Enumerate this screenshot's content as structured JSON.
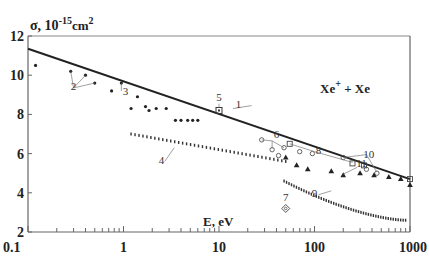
{
  "chart_data": {
    "type": "scatter",
    "title": "",
    "ylabel": "σ, 10^-15 cm^2",
    "ylabel_parts": {
      "base": "σ, 10",
      "exp": "-15",
      "unit": "cm",
      "unit_exp": "2"
    },
    "xlabel": "E, eV",
    "xscale": "log",
    "xlim": [
      0.1,
      1000
    ],
    "ylim": [
      2,
      12
    ],
    "xticks": [
      0.1,
      1,
      10,
      100,
      1000
    ],
    "xtick_labels": [
      "0.1",
      "1",
      "10",
      "100",
      "1000"
    ],
    "yticks": [
      2,
      4,
      6,
      8,
      10,
      12
    ],
    "ytick_labels": [
      "2",
      "4",
      "6",
      "8",
      "10",
      "12"
    ],
    "grid": false,
    "annotation_title": {
      "base": "Xe",
      "sup": "+",
      "rest": " + Xe"
    },
    "series": [
      {
        "name": "1",
        "kind": "line",
        "x": [
          0.1,
          1000
        ],
        "y": [
          11.35,
          4.7
        ]
      },
      {
        "name": "2",
        "kind": "dot",
        "x": [
          0.12,
          0.28,
          0.4,
          0.5
        ],
        "y": [
          10.5,
          10.2,
          10.0,
          9.6
        ]
      },
      {
        "name": "3",
        "kind": "dot",
        "x": [
          0.75,
          0.95,
          1.2,
          1.4,
          1.7,
          1.85,
          2.2,
          2.8,
          3.5,
          4.0,
          4.7,
          5.3,
          6.0
        ],
        "y": [
          9.2,
          9.6,
          8.3,
          8.9,
          8.4,
          8.2,
          8.3,
          8.3,
          7.7,
          7.7,
          7.7,
          7.7,
          7.7
        ]
      },
      {
        "name": "4",
        "kind": "dash",
        "x_range": [
          1.2,
          50
        ],
        "y_range": [
          7.0,
          5.6
        ],
        "count": 40
      },
      {
        "name": "5",
        "kind": "square-dot",
        "x": [
          10
        ],
        "y": [
          8.2
        ]
      },
      {
        "name": "6",
        "kind": "circle",
        "x": [
          28,
          36,
          42,
          48,
          70,
          95
        ],
        "y": [
          6.7,
          6.2,
          5.9,
          6.3,
          6.1,
          6.0
        ]
      },
      {
        "name": "7",
        "kind": "diamond",
        "x": [
          50
        ],
        "y": [
          3.2
        ]
      },
      {
        "name": "8",
        "kind": "square",
        "x": [
          55,
          250
        ],
        "y": [
          6.5,
          5.5
        ]
      },
      {
        "name": "9",
        "kind": "dash",
        "x_range": [
          48,
          900
        ],
        "y_range": [
          4.6,
          2.6
        ],
        "count": 50
      },
      {
        "name": "10",
        "kind": "circle",
        "x": [
          200,
          350,
          450
        ],
        "y": [
          5.8,
          5.2,
          5.0
        ]
      },
      {
        "name": "11",
        "kind": "triangle",
        "x": [
          50,
          65,
          85,
          150,
          200,
          300,
          420,
          600,
          800,
          1000
        ],
        "y": [
          5.8,
          5.4,
          5.2,
          5.1,
          4.9,
          5.0,
          4.9,
          4.8,
          4.7,
          4.4
        ]
      },
      {
        "name": "12",
        "kind": "square",
        "x": [
          330,
          1000
        ],
        "y": [
          5.4,
          4.7
        ]
      }
    ],
    "labels": [
      {
        "text": "1",
        "x": 16,
        "y": 8.35
      },
      {
        "text": "2",
        "x": 0.3,
        "y": 9.25
      },
      {
        "text": "3",
        "x": 1.05,
        "y": 9.0
      },
      {
        "text": "4",
        "x": 2.5,
        "y": 5.45
      },
      {
        "text": "5",
        "x": 10,
        "y": 8.7
      },
      {
        "text": "6",
        "x": 40,
        "y": 6.8
      },
      {
        "text": "7",
        "x": 50,
        "y": 3.6
      },
      {
        "text": "8",
        "x": 110,
        "y": 6.0
      },
      {
        "text": "9",
        "x": 100,
        "y": 3.8
      },
      {
        "text": "10",
        "x": 370,
        "y": 5.8
      },
      {
        "text": "11",
        "x": 310,
        "y": 5.3
      }
    ]
  }
}
